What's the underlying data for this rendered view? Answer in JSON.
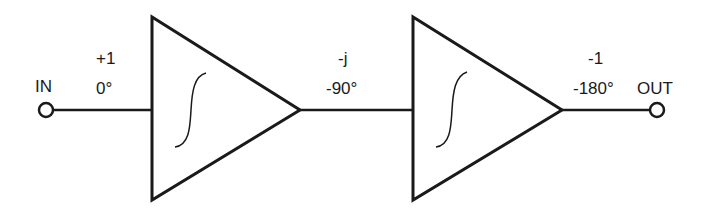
{
  "diagram": {
    "colors": {
      "stroke": "#1a1a1a",
      "background": "#ffffff"
    },
    "input": {
      "label": "IN"
    },
    "output": {
      "label": "OUT"
    },
    "nodes": [
      {
        "id": "n0",
        "gain": "+1",
        "phase": "0°"
      },
      {
        "id": "n1",
        "gain": "-j",
        "phase": "-90°"
      },
      {
        "id": "n2",
        "gain": "-1",
        "phase": "-180°"
      }
    ],
    "stages": [
      {
        "id": "stage1",
        "type": "amplifier",
        "symbol": "integral-icon"
      },
      {
        "id": "stage2",
        "type": "amplifier",
        "symbol": "integral-icon"
      }
    ]
  }
}
